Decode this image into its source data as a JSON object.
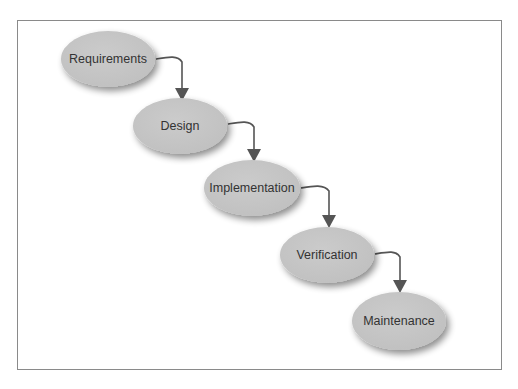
{
  "diagram": {
    "title": "",
    "type": "waterfall-process-flow",
    "colors": {
      "frame_border": "#8a8a8a",
      "node_fill": "#c6c6c6",
      "node_shadow": "#9a9a9a",
      "arrow": "#555555",
      "label_text": "#333333"
    },
    "nodes": [
      {
        "id": "requirements",
        "label": "Requirements",
        "cx": 108,
        "cy": 59,
        "rx": 47,
        "ry": 28
      },
      {
        "id": "design",
        "label": "Design",
        "cx": 180,
        "cy": 126,
        "rx": 47,
        "ry": 28
      },
      {
        "id": "implementation",
        "label": "Implementation",
        "cx": 252,
        "cy": 188,
        "rx": 48,
        "ry": 28
      },
      {
        "id": "verification",
        "label": "Verification",
        "cx": 327,
        "cy": 255,
        "rx": 47,
        "ry": 28
      },
      {
        "id": "maintenance",
        "label": "Maintenance",
        "cx": 399,
        "cy": 321,
        "rx": 47,
        "ry": 29
      }
    ],
    "edges": [
      {
        "from": "requirements",
        "to": "design"
      },
      {
        "from": "design",
        "to": "implementation"
      },
      {
        "from": "implementation",
        "to": "verification"
      },
      {
        "from": "verification",
        "to": "maintenance"
      }
    ]
  }
}
